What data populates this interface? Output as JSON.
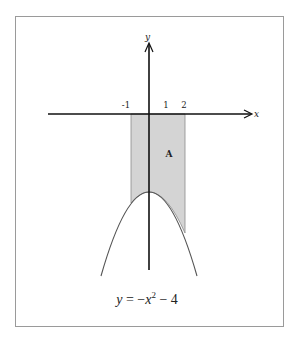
{
  "diagram": {
    "axes": {
      "x_label": "x",
      "y_label": "y",
      "tick_labels": [
        "-1",
        "1",
        "2"
      ]
    },
    "region": {
      "label": "A",
      "x_from": -1,
      "x_to": 2,
      "description": "Shaded region between x-axis and parabola from x=-1 to x=2"
    },
    "curve": {
      "equation_parts": {
        "lhs": "y",
        "eq": " = −",
        "var": "x",
        "exp": "2",
        "rest": " − 4"
      },
      "equation": "y = −x² − 4"
    },
    "colors": {
      "shade": "#d4d4d4",
      "axis": "#111111",
      "curve": "#555555",
      "frame": "#9a9a9a"
    }
  }
}
